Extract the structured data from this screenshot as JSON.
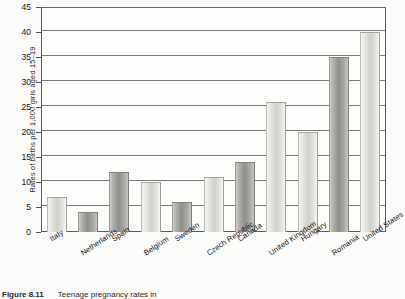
{
  "figure": {
    "caption_number": "Figure 8.11",
    "caption_text": "Teenage pregnancy rates in",
    "background_color": "#fbfbf9"
  },
  "chart_data": {
    "type": "bar",
    "title": "",
    "xlabel": "",
    "ylabel": "Rates of births per 1,000 girls aged 15–19",
    "ylim": [
      0,
      45
    ],
    "ytick_step": 5,
    "yticks": [
      0,
      5,
      10,
      15,
      20,
      25,
      30,
      35,
      40,
      45
    ],
    "grid": "horizontal",
    "legend": "none",
    "categories": [
      "Italy",
      "Netherlands",
      "Spain",
      "Belgium",
      "Sweden",
      "Czech Republic",
      "Canada",
      "United Kingdom",
      "Hungary",
      "Romania",
      "United States"
    ],
    "values": [
      7,
      4,
      12,
      10,
      6,
      11,
      14,
      26,
      20,
      35,
      40
    ],
    "bar_styles": [
      "light",
      "dark",
      "dark",
      "light",
      "dark",
      "light",
      "dark",
      "light",
      "light",
      "dark",
      "light"
    ],
    "colors": {
      "bar_light": "#cfcfcb",
      "bar_dark": "#8f8f8c",
      "gridline": "#7a7a7a",
      "axis": "#5d5d5d",
      "text": "#1d1d1d"
    }
  }
}
